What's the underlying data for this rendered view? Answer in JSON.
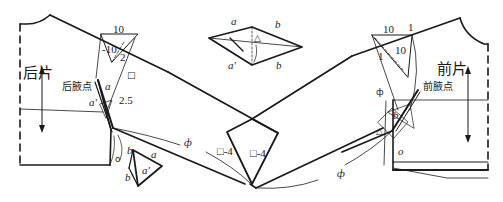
{
  "diagram": {
    "type": "garment pattern drafting diagram (sleeve / shoulder dart transfer)",
    "back_piece": {
      "title": "后片",
      "armpit_point_label": "后腋点",
      "measurements": {
        "top": "10",
        "inner": "-10",
        "slope": "2",
        "offset": "2.5"
      },
      "markers": {
        "a": "a",
        "a_prime": "a'",
        "square": "□",
        "circle": "o"
      }
    },
    "front_piece": {
      "title": "前片",
      "armpit_point_label": "前腋点",
      "measurements": {
        "top": "10",
        "corner": "1",
        "inner": "10",
        "slope": "1"
      },
      "markers": {
        "b": "b",
        "triangle": "△",
        "circle": "o",
        "phi": "ф"
      }
    },
    "top_diamond": {
      "a_top": "a",
      "a_bottom": "a'",
      "b_top": "b",
      "b_bottom": "b",
      "triangle": "△"
    },
    "center_gusset": {
      "left_label": "□-4",
      "right_label": "□-4"
    },
    "small_triangle": {
      "b_top": "b",
      "b_bottom": "b'",
      "a": "a",
      "a_prime": "a'"
    },
    "curve_labels": {
      "left_phi": "ф",
      "right_phi": "ф"
    },
    "colors": {
      "line": "#1a1a1a",
      "thin_line": "#333333",
      "background": "#ffffff"
    }
  }
}
